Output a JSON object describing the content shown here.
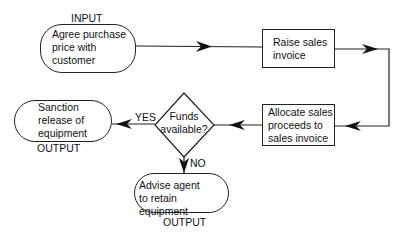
{
  "diagram": {
    "type": "flowchart",
    "nodes": {
      "agree": {
        "label_above": "INPUT",
        "lines": [
          "Agree purchase",
          "price with",
          "customer"
        ],
        "shape": "terminator"
      },
      "raise": {
        "lines": [
          "Raise sales",
          "invoice"
        ],
        "shape": "process"
      },
      "allocate": {
        "lines": [
          "Allocate sales",
          "proceeds to",
          "sales invoice"
        ],
        "shape": "process"
      },
      "funds": {
        "lines": [
          "Funds",
          "available?"
        ],
        "shape": "decision"
      },
      "sanction": {
        "lines": [
          "Sanction",
          "release of",
          "equipment"
        ],
        "label_below": "OUTPUT",
        "shape": "terminator"
      },
      "advise": {
        "lines": [
          "Advise agent",
          "to retain equipment"
        ],
        "label_below": "OUTPUT",
        "shape": "terminator"
      }
    },
    "edges": {
      "yes": "YES",
      "no": "NO"
    },
    "colors": {
      "line": "#222222",
      "background": "#ffffff"
    }
  }
}
